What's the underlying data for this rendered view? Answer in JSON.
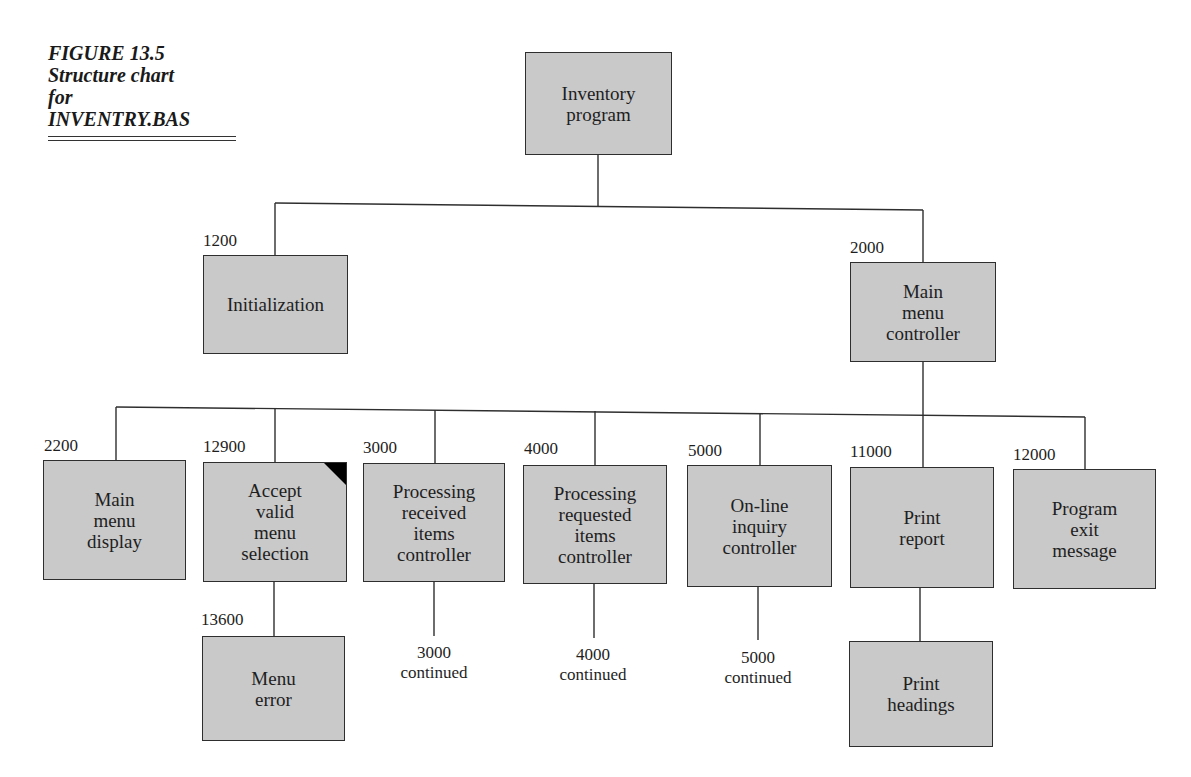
{
  "caption": {
    "figure": "FIGURE 13.5",
    "line1": "Structure chart",
    "line2": "for",
    "line3": "INVENTRY.BAS"
  },
  "colors": {
    "box_fill": "#c9c9c9",
    "border": "#2e2e2e",
    "flag": "#000000"
  },
  "nodes": [
    {
      "id": "root",
      "number": "",
      "label": "Inventory\nprogram"
    },
    {
      "id": "n1200",
      "number": "1200",
      "label": "Initialization"
    },
    {
      "id": "n2000",
      "number": "2000",
      "label": "Main\nmenu\ncontroller"
    },
    {
      "id": "n2200",
      "number": "2200",
      "label": "Main\nmenu\ndisplay"
    },
    {
      "id": "n12900",
      "number": "12900",
      "label": "Accept\nvalid\nmenu\nselection",
      "flagged": true
    },
    {
      "id": "n3000",
      "number": "3000",
      "label": "Processing\nreceived\nitems\ncontroller"
    },
    {
      "id": "n4000",
      "number": "4000",
      "label": "Processing\nrequested\nitems\ncontroller"
    },
    {
      "id": "n5000",
      "number": "5000",
      "label": "On-line\ninquiry\ncontroller"
    },
    {
      "id": "n11000",
      "number": "11000",
      "label": "Print\nreport"
    },
    {
      "id": "n12000",
      "number": "12000",
      "label": "Program\nexit\nmessage"
    },
    {
      "id": "n13600",
      "number": "13600",
      "label": "Menu\nerror"
    },
    {
      "id": "nPH",
      "number": "",
      "label": "Print\nheadings"
    }
  ],
  "continuations": [
    {
      "id": "c3000",
      "text": "3000\ncontinued"
    },
    {
      "id": "c4000",
      "text": "4000\ncontinued"
    },
    {
      "id": "c5000",
      "text": "5000\ncontinued"
    }
  ]
}
